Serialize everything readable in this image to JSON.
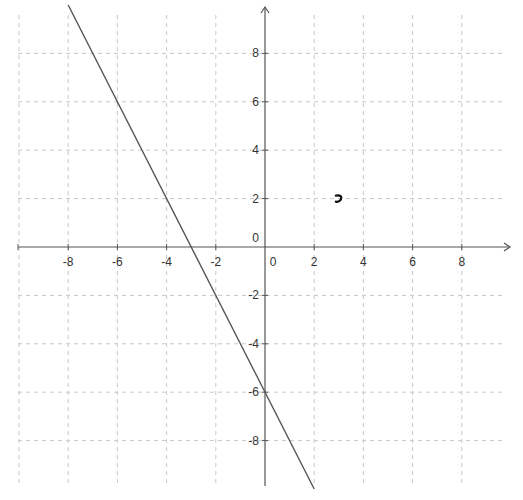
{
  "chart_data": {
    "type": "line",
    "title": "",
    "xlabel": "",
    "ylabel": "",
    "xlim": [
      -10,
      10
    ],
    "ylim": [
      -10,
      10
    ],
    "grid": true,
    "grid_style": "dashed",
    "x_ticks": [
      -8,
      -6,
      -4,
      -2,
      0,
      2,
      4,
      6,
      8
    ],
    "y_ticks": [
      -8,
      -6,
      -4,
      -2,
      0,
      2,
      4,
      6,
      8
    ],
    "x_tick_labels": [
      "-8",
      "-6",
      "-4",
      "-2",
      "0",
      "2",
      "4",
      "6",
      "8"
    ],
    "y_tick_labels": [
      "-8",
      "-6",
      "-4",
      "-2",
      "0",
      "2",
      "4",
      "6",
      "8"
    ],
    "origin_label": "0",
    "series": [
      {
        "name": "line",
        "equation": "y = -2x - 6",
        "x": [
          -8,
          -6,
          -4,
          -3,
          0,
          2
        ],
        "y": [
          10,
          6,
          2,
          0,
          -6,
          -10
        ],
        "color": "#555555"
      }
    ],
    "annotations": [
      {
        "type": "point-mark",
        "x": 3,
        "y": 2,
        "color": "#111111"
      }
    ]
  },
  "colors": {
    "axis": "#555555",
    "grid": "#c8c8c8",
    "line": "#555555",
    "text": "#333333"
  }
}
